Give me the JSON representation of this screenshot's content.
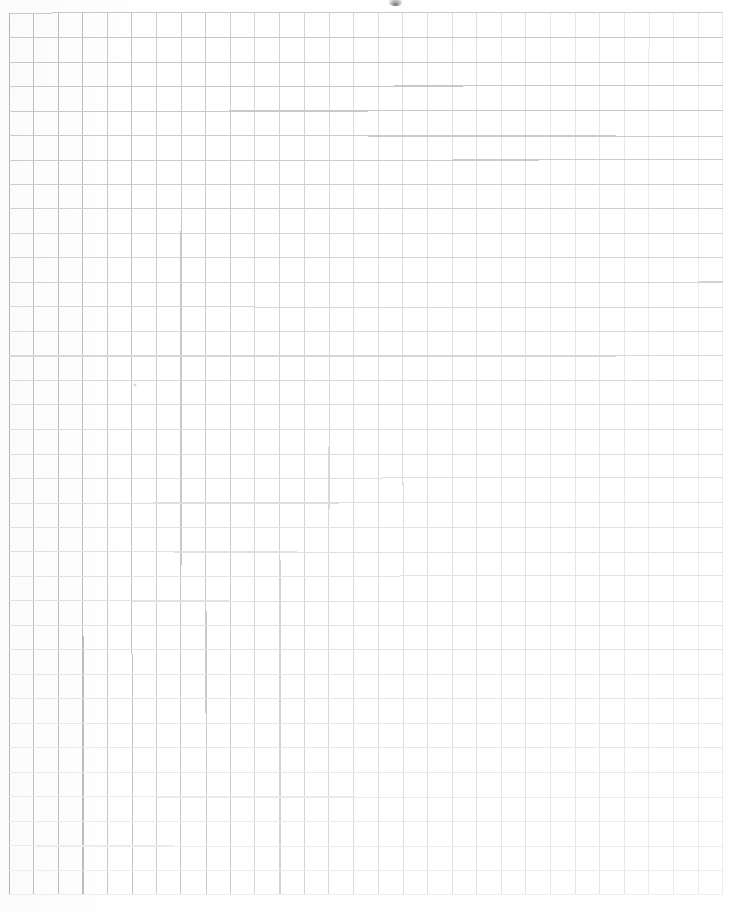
{
  "document": {
    "kind": "graph-paper-scan",
    "title": "Blank Graph Paper",
    "background_color": "#ffffff",
    "width": 739,
    "height": 913
  },
  "grid": {
    "label": "quadrille ruling",
    "origin_x": 9,
    "origin_y": 13,
    "cell_width": 24.62,
    "cell_height": 24.5,
    "columns": 29,
    "rows": 36,
    "right_edge": 723,
    "bottom_edge": 895,
    "line_width": 1,
    "color_left": "#b4b4b4",
    "color_mid": "#dcdcdc",
    "color_right": "#ececec",
    "color_top": "#c4c4c4",
    "color_bottom": "#eeeeee",
    "fade_direction": "darker at left and top, fading toward right and bottom"
  },
  "artifacts": [
    {
      "name": "top-edge-smudge",
      "description": "small dark smudge clipped by the top edge of the scan",
      "x": 388,
      "y": -3,
      "width": 15,
      "height": 9,
      "color": "#464646"
    },
    {
      "name": "paper-speck",
      "description": "faint speck on the paper",
      "x": 133,
      "y": 383,
      "width": 4,
      "height": 4,
      "color": "#969696"
    }
  ],
  "caption": "Blank sheet of quadrille graph paper, 29 columns by 36 rows."
}
